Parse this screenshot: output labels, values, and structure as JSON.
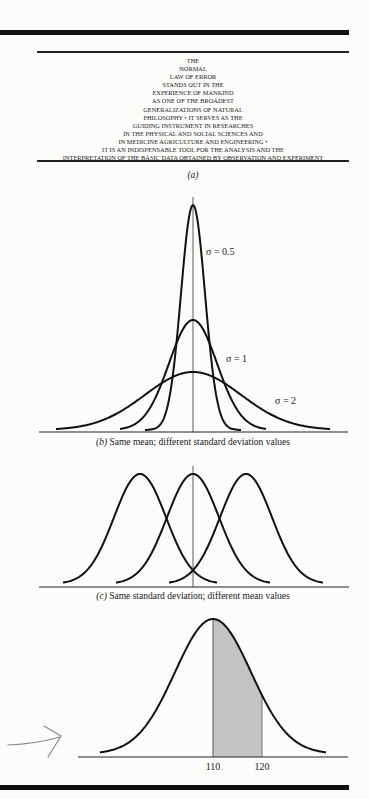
{
  "epigraph": {
    "lines": [
      "THE",
      "NORMAL",
      "LAW OF ERROR",
      "STANDS OUT IN THE",
      "EXPERIENCE OF MANKIND",
      "AS ONE OF THE BROADEST",
      "GENERALIZATIONS OF NATURAL",
      "PHILOSOPHY • IT SERVES AS THE",
      "GUIDING INSTRUMENT IN RESEARCHES",
      "IN THE PHYSICAL AND SOCIAL SCIENCES AND",
      "IN MEDICINE AGRICULTURE AND ENGINEERING •",
      "IT IS AN INDISPENSABLE TOOL FOR THE ANALYSIS AND THE",
      "INTERPRETATION OF THE BASIC DATA OBTAINED BY OBSERVATION AND EXPERIMENT"
    ]
  },
  "captions": {
    "a_tag": "(a)",
    "b_tag": "(b)",
    "b_text": " Same mean; different standard deviation values",
    "c_tag": "(c)",
    "c_text": " Same standard deviation; different mean values"
  },
  "annotation": {
    "type": "hand-drawn-arrow",
    "color": "#8a8a8a"
  },
  "chart_data": [
    {
      "id": "b",
      "type": "line",
      "title": "(b) Same mean; different standard deviation values",
      "xlabel": "",
      "ylabel": "",
      "grid": false,
      "mean": 0,
      "series": [
        {
          "name": "σ = 0.5",
          "sigma": 0.5,
          "label": "σ = 0.5"
        },
        {
          "name": "σ = 1",
          "sigma": 1,
          "label": "σ = 1"
        },
        {
          "name": "σ = 2",
          "sigma": 2,
          "label": "σ = 2"
        }
      ],
      "xlim": [
        -6,
        6
      ]
    },
    {
      "id": "c",
      "type": "line",
      "title": "(c) Same standard deviation; different mean values",
      "xlabel": "",
      "ylabel": "",
      "grid": false,
      "sigma": 1,
      "series": [
        {
          "name": "mean -2",
          "mean": -2
        },
        {
          "name": "mean 0",
          "mean": 0
        },
        {
          "name": "mean +2",
          "mean": 2
        }
      ]
    },
    {
      "id": "d",
      "type": "area",
      "title": "",
      "xlabel": "",
      "ylabel": "",
      "grid": false,
      "mean": 110,
      "shaded_region": [
        110,
        120
      ],
      "tick_labels": [
        "110",
        "120"
      ],
      "shade_color": "#c4c4c4"
    }
  ]
}
